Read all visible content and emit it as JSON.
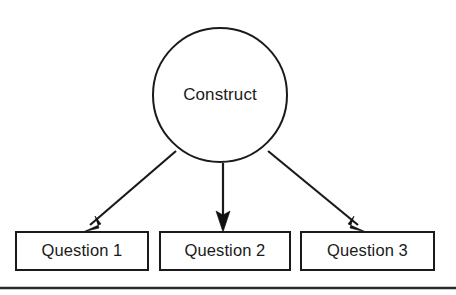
{
  "diagram": {
    "type": "construct-to-questions-measurement-model",
    "background_color": "#ffffff",
    "line_color": "#1a1a1a",
    "construct_node": {
      "label": "Construct",
      "shape": "circle",
      "center_x": 220,
      "center_y": 95,
      "radius": 67
    },
    "question_nodes": [
      {
        "label": "Question 1",
        "shape": "rectangle",
        "x": 16,
        "y": 232,
        "width": 132,
        "height": 38
      },
      {
        "label": "Question 2",
        "shape": "rectangle",
        "x": 160,
        "y": 232,
        "width": 130,
        "height": 38
      },
      {
        "label": "Question 3",
        "shape": "rectangle",
        "x": 301,
        "y": 232,
        "width": 133,
        "height": 38
      }
    ],
    "arrows": [
      {
        "name": "arrow-construct-to-question-1",
        "from_x": 176,
        "from_y": 151,
        "to_x": 83,
        "to_y": 231
      },
      {
        "name": "arrow-construct-to-question-2",
        "from_x": 223,
        "from_y": 163,
        "to_x": 223,
        "to_y": 231
      },
      {
        "name": "arrow-construct-to-question-3",
        "from_x": 268,
        "from_y": 151,
        "to_x": 366,
        "to_y": 231
      }
    ],
    "page_rule": {
      "x1": 0,
      "y1": 288,
      "x2": 456,
      "y2": 288
    }
  }
}
